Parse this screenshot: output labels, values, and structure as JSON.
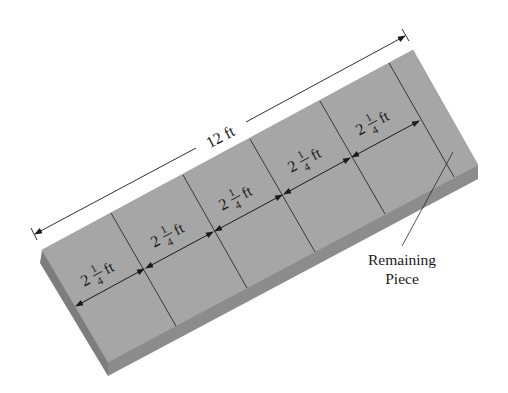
{
  "diagram": {
    "title_dimension": "12 ft",
    "segments": [
      {
        "whole": "2",
        "num": "1",
        "den": "4",
        "unit": "ft"
      },
      {
        "whole": "2",
        "num": "1",
        "den": "4",
        "unit": "ft"
      },
      {
        "whole": "2",
        "num": "1",
        "den": "4",
        "unit": "ft"
      },
      {
        "whole": "2",
        "num": "1",
        "den": "4",
        "unit": "ft"
      },
      {
        "whole": "2",
        "num": "1",
        "den": "4",
        "unit": "ft"
      }
    ],
    "callout_line1": "Remaining",
    "callout_line2": "Piece",
    "colors": {
      "board_top": "#a9a9a9",
      "board_front": "#8a8a8a",
      "board_side": "#7a7a7a",
      "ink": "#1a1a1a"
    }
  }
}
